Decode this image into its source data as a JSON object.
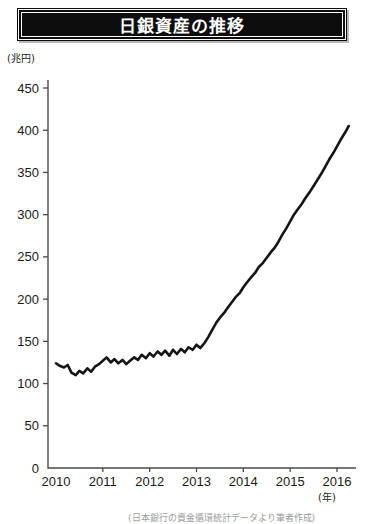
{
  "title": "日銀資産の推移",
  "axis": {
    "y_unit": "(兆円)",
    "x_unit": "(年)"
  },
  "source_note": "(日本銀行の資金循環統計データより筆者作成)",
  "colors": {
    "banner_background": "#0d0d0d",
    "banner_text": "#ffffff",
    "series_line": "#151515",
    "axis": "#4a4a4a",
    "page_background": "#ffffff"
  },
  "chart_data": {
    "type": "line",
    "title": "日銀資産の推移",
    "xlabel": "(年)",
    "ylabel": "(兆円)",
    "xlim": [
      2010.0,
      2016.25
    ],
    "ylim": [
      0,
      450
    ],
    "yticks": [
      0,
      50,
      100,
      150,
      200,
      250,
      300,
      350,
      400,
      450
    ],
    "xticks": [
      2010,
      2011,
      2012,
      2013,
      2014,
      2015,
      2016
    ],
    "xtick_labels": [
      "2010",
      "2011",
      "2012",
      "2013",
      "2014",
      "2015",
      "2016"
    ],
    "ytick_labels": [
      "0",
      "50",
      "100",
      "150",
      "200",
      "250",
      "300",
      "350",
      "400",
      "450"
    ],
    "grid": false,
    "legend": null,
    "series": [
      {
        "name": "日銀総資産",
        "unit": "兆円",
        "x": [
          2010.0,
          2010.08,
          2010.17,
          2010.25,
          2010.33,
          2010.42,
          2010.5,
          2010.58,
          2010.67,
          2010.75,
          2010.83,
          2010.92,
          2011.0,
          2011.08,
          2011.17,
          2011.25,
          2011.33,
          2011.42,
          2011.5,
          2011.58,
          2011.67,
          2011.75,
          2011.83,
          2011.92,
          2012.0,
          2012.08,
          2012.17,
          2012.25,
          2012.33,
          2012.42,
          2012.5,
          2012.58,
          2012.67,
          2012.75,
          2012.83,
          2012.92,
          2013.0,
          2013.08,
          2013.17,
          2013.25,
          2013.33,
          2013.42,
          2013.5,
          2013.58,
          2013.67,
          2013.75,
          2013.83,
          2013.92,
          2014.0,
          2014.08,
          2014.17,
          2014.25,
          2014.33,
          2014.42,
          2014.5,
          2014.58,
          2014.67,
          2014.75,
          2014.83,
          2014.92,
          2015.0,
          2015.08,
          2015.17,
          2015.25,
          2015.33,
          2015.42,
          2015.5,
          2015.58,
          2015.67,
          2015.75,
          2015.83,
          2015.92,
          2016.0,
          2016.08,
          2016.17,
          2016.25
        ],
        "values": [
          124,
          121,
          119,
          122,
          113,
          110,
          115,
          112,
          118,
          114,
          120,
          123,
          127,
          131,
          125,
          129,
          124,
          128,
          123,
          127,
          131,
          128,
          134,
          130,
          136,
          132,
          138,
          134,
          139,
          133,
          140,
          135,
          141,
          137,
          143,
          140,
          146,
          142,
          148,
          155,
          163,
          172,
          178,
          183,
          190,
          196,
          202,
          207,
          214,
          220,
          226,
          231,
          238,
          243,
          249,
          255,
          261,
          268,
          276,
          284,
          292,
          300,
          307,
          313,
          320,
          327,
          334,
          341,
          349,
          357,
          365,
          373,
          381,
          389,
          397,
          405
        ]
      }
    ],
    "annotations": [
      {
        "label": "2013年4月 量的・質的金融緩和開始",
        "x": 2013.25,
        "y": 155
      }
    ],
    "summary": {
      "start_value": 124,
      "start_year": "2010",
      "end_value": 405,
      "end_year": "2016",
      "min_value": 110,
      "max_value": 405
    }
  }
}
